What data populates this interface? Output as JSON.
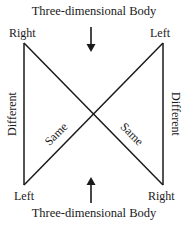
{
  "diagram": {
    "top_title": "Three-dimensional Body",
    "bottom_title": "Three-dimensional Body",
    "corners": {
      "top_left": "Right",
      "top_right": "Left",
      "bottom_left": "Left",
      "bottom_right": "Right"
    },
    "sides": {
      "left": "Different",
      "right": "Different"
    },
    "diagonals": {
      "left_lower": "Same",
      "right_lower": "Same"
    },
    "arrows": {
      "top": "arrow-down",
      "bottom": "arrow-up"
    },
    "colors": {
      "line": "#1a1a1a",
      "background": "#ffffff"
    }
  }
}
